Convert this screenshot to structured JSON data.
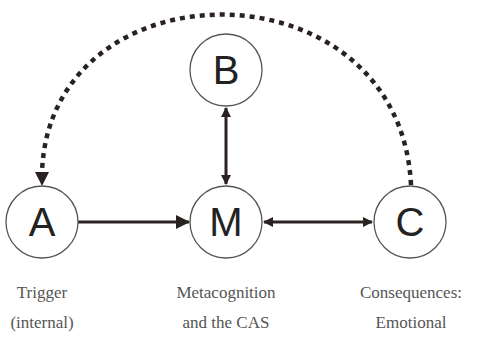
{
  "diagram": {
    "type": "flow",
    "colors": {
      "node_stroke": "#555555",
      "arrow": "#2a2220",
      "label_text": "#555555",
      "letter_text": "#222222"
    },
    "nodes": [
      {
        "id": "A",
        "letter": "A",
        "label_line1": "Trigger",
        "label_line2": "(internal)"
      },
      {
        "id": "B",
        "letter": "B"
      },
      {
        "id": "M",
        "letter": "M",
        "label_line1": "Metacognition",
        "label_line2": "and the CAS"
      },
      {
        "id": "C",
        "letter": "C",
        "label_line1": "Consequences:",
        "label_line2": "Emotional"
      }
    ],
    "edges": [
      {
        "from": "A",
        "to": "M",
        "style": "solid",
        "direction": "forward"
      },
      {
        "from": "B",
        "to": "M",
        "style": "solid",
        "direction": "bidirectional"
      },
      {
        "from": "M",
        "to": "C",
        "style": "solid",
        "direction": "bidirectional"
      },
      {
        "from": "C",
        "to": "A",
        "style": "dashed",
        "direction": "forward"
      }
    ]
  }
}
